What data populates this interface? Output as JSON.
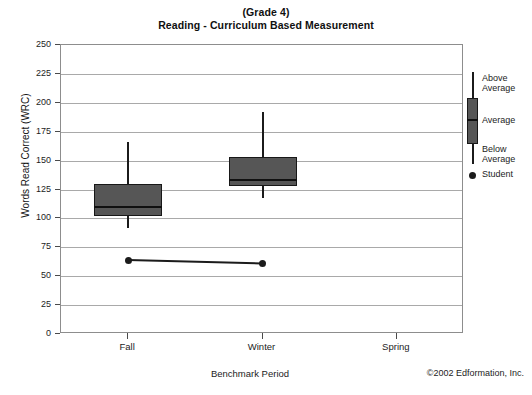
{
  "title": {
    "line1": "(Grade 4)",
    "line2": "Reading - Curriculum Based Measurement"
  },
  "footer": {
    "copyright": "©2002 Edformation, Inc."
  },
  "legend": {
    "above_average": "Above\nAverage",
    "above_average_line1": "Above",
    "above_average_line2": "Average",
    "average": "Average",
    "below_average_line1": "Below",
    "below_average_line2": "Average",
    "student": "Student"
  },
  "colors": {
    "box_fill": "#565656",
    "box_outline": "#181818",
    "whisker": "#1b1b1b",
    "student_marker": "#1b1b1b",
    "gridline": "#a9a9a9",
    "frame": "#8d8d8d",
    "text": "#1c1c1c"
  },
  "chart_data": {
    "type": "box",
    "title": "(Grade 4) Reading - Curriculum Based Measurement",
    "xlabel": "Benchmark Period",
    "ylabel": "Words Read Correct (WRC)",
    "categories": [
      "Fall",
      "Winter",
      "Spring"
    ],
    "ylim": [
      0,
      250
    ],
    "yticks": [
      0,
      25,
      50,
      75,
      100,
      125,
      150,
      175,
      200,
      225,
      250
    ],
    "ytick_labels": [
      "0",
      "25",
      "50",
      "75",
      "100",
      "125",
      "150",
      "175",
      "200",
      "225",
      "250"
    ],
    "grid": true,
    "legend_position": "right-outside",
    "boxes": [
      {
        "category": "Fall",
        "whisker_low": 92,
        "q1": 102,
        "median": 110,
        "q3": 130,
        "whisker_high": 166
      },
      {
        "category": "Winter",
        "whisker_low": 118,
        "q1": 128,
        "median": 133,
        "q3": 153,
        "whisker_high": 192
      },
      {
        "category": "Spring",
        "whisker_low": null,
        "q1": null,
        "median": null,
        "q3": null,
        "whisker_high": null
      }
    ],
    "series": [
      {
        "name": "Student",
        "x": [
          "Fall",
          "Winter"
        ],
        "values": [
          64,
          61
        ]
      }
    ]
  }
}
